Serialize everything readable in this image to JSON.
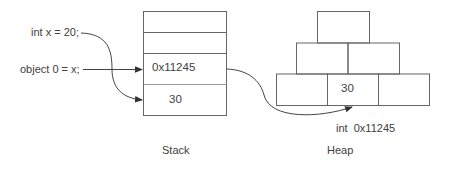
{
  "code": {
    "line1": "int x = 20;",
    "line2": "object 0 = x;"
  },
  "stack": {
    "label": "Stack",
    "cells": [
      "",
      "",
      "0x11245",
      "30"
    ]
  },
  "heap": {
    "label": "Heap",
    "top_row": [
      ""
    ],
    "middle_row": [
      "",
      ""
    ],
    "bottom_row": [
      "",
      "30",
      ""
    ],
    "annotation": "int  0x11245"
  },
  "colors": {
    "line": "#555555",
    "text": "#404040",
    "background": "#ffffff"
  }
}
